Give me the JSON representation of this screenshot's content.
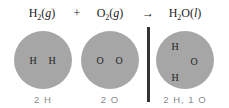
{
  "equation": {
    "reactant1": {
      "symbol": "H",
      "subscript": "2",
      "state": "g"
    },
    "plus": "+",
    "reactant2": {
      "symbol": "O",
      "subscript": "2",
      "state": "g"
    },
    "arrow": "→",
    "product": {
      "symbol": "H",
      "subscript": "2",
      "rest": "O",
      "state": "l"
    }
  },
  "circles": [
    {
      "atoms": [
        "H",
        "H"
      ],
      "count": "2 H"
    },
    {
      "atoms": [
        "O",
        "O"
      ],
      "count": "2 O"
    },
    {
      "atoms": [
        "H",
        "O",
        "H"
      ],
      "count": "2 H, 1 O"
    }
  ],
  "colors": {
    "circle_fill": "#a6a6a6",
    "divider": "#333333",
    "count_text": "#8a8a8a"
  }
}
